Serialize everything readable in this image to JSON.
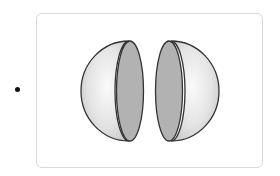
{
  "item": {
    "bullet": "•",
    "figure": {
      "description": "Sphere split into two hemispheres showing circular cross-sections",
      "parts": [
        {
          "name": "left-hemisphere",
          "dome_fill": "#e6e6e6",
          "face_fill": "#b3b3b3"
        },
        {
          "name": "right-hemisphere",
          "dome_fill": "#e6e6e6",
          "face_fill": "#b3b3b3"
        }
      ],
      "stroke_color": "#333333"
    }
  }
}
